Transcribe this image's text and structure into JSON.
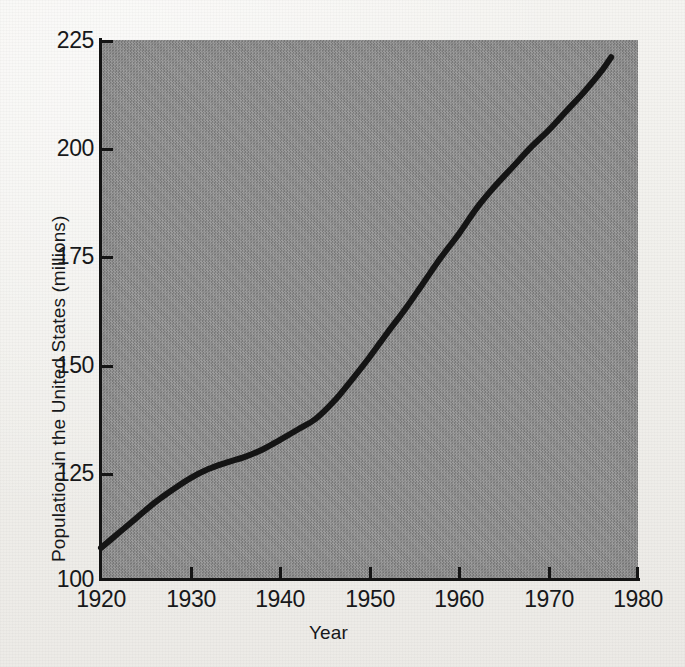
{
  "figure": {
    "kind": "scanned-line-chart",
    "plot_background_color": "#8c8c8c",
    "page_background_color": "#f3f2ef",
    "ink_color": "#141414"
  },
  "chart_data": {
    "type": "line",
    "title": "",
    "xlabel": "Year",
    "ylabel": "Population in the United States (millions)",
    "xlim": [
      1920,
      1980
    ],
    "ylim": [
      100,
      225
    ],
    "xticks": [
      1920,
      1930,
      1940,
      1950,
      1960,
      1970,
      1980
    ],
    "yticks": [
      100,
      125,
      150,
      175,
      200,
      225
    ],
    "xtick_labels": [
      "1920",
      "1930",
      "1940",
      "1950",
      "1960",
      "1970",
      "1980"
    ],
    "ytick_labels": [
      "100",
      "125",
      "150",
      "175",
      "200",
      "225"
    ],
    "grid": false,
    "legend": null,
    "legend_position": "none",
    "series": [
      {
        "name": "United States population",
        "color": "#141414",
        "line_width": 6,
        "x": [
          1920,
          1922,
          1924,
          1926,
          1928,
          1930,
          1932,
          1934,
          1936,
          1938,
          1940,
          1942,
          1944,
          1946,
          1948,
          1950,
          1952,
          1954,
          1956,
          1958,
          1960,
          1962,
          1964,
          1966,
          1968,
          1970,
          1972,
          1974,
          1976,
          1977
        ],
        "values": [
          107,
          110.5,
          114,
          117.5,
          120.5,
          123.2,
          125.3,
          126.8,
          128.1,
          129.8,
          132.1,
          134.5,
          137.0,
          141.0,
          146.0,
          151.3,
          157.0,
          162.5,
          168.5,
          174.5,
          180.0,
          186.0,
          191.0,
          195.5,
          200.0,
          204.0,
          208.5,
          213.0,
          218.0,
          221.0
        ],
        "annotations": []
      }
    ]
  },
  "axes": {
    "y_tick_positions_px": [
      578,
      473,
      365,
      256,
      148,
      40
    ],
    "x_tick_positions_px": [
      101,
      191,
      280,
      370,
      459,
      549,
      638
    ]
  }
}
